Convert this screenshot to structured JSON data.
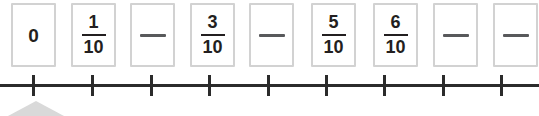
{
  "exercise": {
    "type": "fraction-number-line",
    "denominator": 10,
    "blank_marker": "—",
    "colors": {
      "box_border": "#d2d2d2",
      "text": "#231f20",
      "axis": "#2b2b2b",
      "chevron": "#d9d9d9"
    },
    "boxes": [
      {
        "kind": "whole",
        "value": "0",
        "numerator": "",
        "denominator": "",
        "x": 11
      },
      {
        "kind": "fraction",
        "value": "",
        "numerator": "1",
        "denominator": "10",
        "x": 71
      },
      {
        "kind": "blank",
        "value": "—",
        "numerator": "",
        "denominator": "",
        "x": 130
      },
      {
        "kind": "fraction",
        "value": "",
        "numerator": "3",
        "denominator": "10",
        "x": 190
      },
      {
        "kind": "blank",
        "value": "—",
        "numerator": "",
        "denominator": "",
        "x": 249
      },
      {
        "kind": "fraction",
        "value": "",
        "numerator": "5",
        "denominator": "10",
        "x": 311
      },
      {
        "kind": "fraction",
        "value": "",
        "numerator": "6",
        "denominator": "10",
        "x": 373
      },
      {
        "kind": "blank",
        "value": "—",
        "numerator": "",
        "denominator": "",
        "x": 433
      },
      {
        "kind": "blank",
        "value": "—",
        "numerator": "",
        "denominator": "",
        "x": 493
      }
    ],
    "number_line": {
      "tick_count": 9,
      "tick_positions": [
        32,
        91,
        150,
        208,
        267,
        325,
        383,
        442,
        500
      ]
    }
  }
}
